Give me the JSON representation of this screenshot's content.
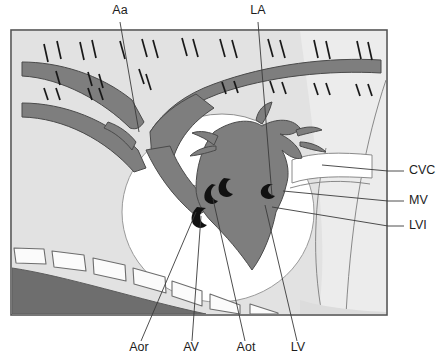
{
  "figure": {
    "kind": "labelled line drawing"
  },
  "colors": {
    "background": "#ffffff",
    "panel_fill": "#e2e2e2",
    "vessel_fill": "#7e7e7e",
    "vessel_stroke": "#4a4a4a",
    "chamber_fill": "#ffffff",
    "valve_fill": "#111111",
    "dark_wedge": "#6e6e6e",
    "bone_fill": "#fbfbfb",
    "bone_stroke": "#6d6d6d",
    "frame_stroke": "#555555",
    "leader_stroke": "#3a3a3a",
    "label_text": "#1d1d1d"
  },
  "labels": {
    "top": [
      {
        "id": "Aa",
        "text": "Aa",
        "x": 120,
        "y": 14,
        "anchor": "middle",
        "meaning": "aortic arch"
      },
      {
        "id": "LA",
        "text": "LA",
        "x": 258,
        "y": 14,
        "anchor": "middle",
        "meaning": "left atrium"
      }
    ],
    "right": [
      {
        "id": "CVC",
        "text": "CVC",
        "x": 409,
        "y": 174,
        "anchor": "start",
        "meaning": "caudal vena cava"
      },
      {
        "id": "MV",
        "text": "MV",
        "x": 409,
        "y": 204,
        "anchor": "start",
        "meaning": "mitral valve"
      },
      {
        "id": "LVI",
        "text": "LVI",
        "x": 409,
        "y": 229,
        "anchor": "start",
        "meaning": "left ventricular inlet"
      }
    ],
    "bottom": [
      {
        "id": "Aor",
        "text": "Aor",
        "x": 139,
        "y": 351,
        "anchor": "middle",
        "meaning": "aortic root"
      },
      {
        "id": "AV",
        "text": "AV",
        "x": 191,
        "y": 351,
        "anchor": "middle",
        "meaning": "aortic valve"
      },
      {
        "id": "Aot",
        "text": "Aot",
        "x": 246,
        "y": 351,
        "anchor": "middle",
        "meaning": "aortic outflow tract"
      },
      {
        "id": "LV",
        "text": "LV",
        "x": 298,
        "y": 351,
        "anchor": "middle",
        "meaning": "left ventricle"
      }
    ]
  },
  "leaders": {
    "Aa": "M120,22 L139,132",
    "LA": "M258,22 L272,196",
    "CVC": "M404,171 L388,171 L322,165",
    "MV": "M404,201 L388,201 L283,191",
    "LVI": "M404,226 L388,226 L272,207",
    "Aor": "M141,341 L196,212",
    "AV": "M192,341 L201,216",
    "Aot": "M245,341 L213,199",
    "LV": "M297,341 L265,205"
  },
  "frame": {
    "x": 11,
    "y": 30,
    "width": 376,
    "height": 285
  }
}
